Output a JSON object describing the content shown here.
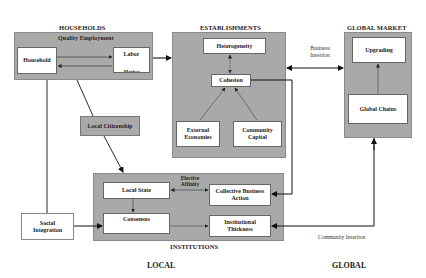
{
  "groups": {
    "households": {
      "title": "HOUSEHOLDS",
      "subtitle": "Quality Employment"
    },
    "establishments": {
      "title": "ESTABLISHMENTS"
    },
    "global_market": {
      "title": "GLOBAL MARKET"
    },
    "institutions": {
      "title": "INSTITUTIONS"
    }
  },
  "nodes": {
    "household": "Household",
    "labor_market_1": "Labor",
    "labor_market_2": "Market",
    "heterogeneity": "Heterogeneity",
    "cohesion": "Cohesion",
    "external_economies_1": "External",
    "external_economies_2": "Economies",
    "community_capital_1": "Community",
    "community_capital_2": "Capital",
    "upgrading": "Upgrading",
    "global_chains": "Global Chains",
    "local_citizenship": "Local Citizenship",
    "local_state": "Local State",
    "consensus": "Consensus",
    "collective_business_action_1": "Collective Business",
    "collective_business_action_2": "Action",
    "institutional_thickness_1": "Institutional",
    "institutional_thickness_2": "Thickness",
    "social_integration_1": "Social",
    "social_integration_2": "Integration"
  },
  "edge_labels": {
    "business_insertion_1": "Business",
    "business_insertion_2": "Insertion",
    "elective_affinity_1": "Elective",
    "elective_affinity_2": "Affinity",
    "community_insertion": "Community Insertion"
  },
  "scale_labels": {
    "local": "LOCAL",
    "global": "GLOBAL"
  }
}
